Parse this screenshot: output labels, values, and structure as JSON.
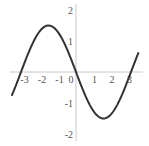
{
  "chart_data": {
    "type": "line",
    "title": "",
    "xlabel": "",
    "ylabel": "",
    "function": "y = -1.5 sin(x)",
    "xlim": [
      -3.7,
      3.8
    ],
    "ylim": [
      -2.2,
      2.2
    ],
    "grid": false,
    "x_ticks": [
      -3,
      -2,
      -1,
      0,
      1,
      2,
      3
    ],
    "x_tick_labels": [
      "-3",
      "-2",
      "-1",
      "0",
      "1",
      "2",
      "3"
    ],
    "y_ticks": [
      2,
      1,
      -1,
      -2
    ],
    "y_tick_labels": [
      "2",
      "1",
      "-1",
      "-2"
    ],
    "series": [
      {
        "name": "-1.5 sin(x)",
        "x_range": [
          -3.66,
          3.56
        ],
        "key_points": [
          {
            "x": -3.66,
            "y": -0.75
          },
          {
            "x": -3.14,
            "y": 0
          },
          {
            "x": -1.57,
            "y": 1.5
          },
          {
            "x": 0,
            "y": 0
          },
          {
            "x": 1.57,
            "y": -1.5
          },
          {
            "x": 3.14,
            "y": 0
          },
          {
            "x": 3.56,
            "y": 0.61
          }
        ],
        "amplitude": 1.5,
        "color": "#333333"
      }
    ]
  },
  "layout": {
    "origin_px": [
      76,
      72
    ],
    "unit_x_px": 17.5,
    "unit_y_px": 31,
    "x_axis_px_range": [
      10,
      143
    ],
    "y_axis_px_range": [
      4,
      141
    ]
  },
  "colors": {
    "curve": "#333333",
    "axis": "#c8c8c8",
    "labels": "#555555"
  }
}
